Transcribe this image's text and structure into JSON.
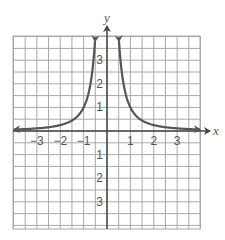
{
  "chart_data": {
    "type": "line",
    "title": "",
    "xlabel": "x",
    "ylabel": "y",
    "xlim": [
      -4,
      4
    ],
    "ylim": [
      -4,
      4
    ],
    "grid": true,
    "grid_step": 0.5,
    "x_ticks": [
      -3,
      -2,
      -1,
      1,
      2,
      3
    ],
    "x_tick_labels": [
      "−3",
      "−2",
      "−1",
      "1",
      "2",
      "3"
    ],
    "y_ticks": [
      3,
      2,
      1,
      -1,
      -2,
      -3
    ],
    "y_tick_labels": [
      "3",
      "2",
      "1",
      "1",
      "2",
      "3"
    ],
    "series": [
      {
        "name": "y = 1/x²",
        "function": "1/x^2",
        "x": [
          -4,
          -3,
          -2,
          -1.5,
          -1,
          -0.75,
          -0.5,
          0.5,
          0.75,
          1,
          1.5,
          2,
          3,
          4
        ],
        "values": [
          0.0625,
          0.111,
          0.25,
          0.444,
          1,
          1.778,
          4,
          4,
          1.778,
          1,
          0.444,
          0.25,
          0.111,
          0.0625
        ],
        "color": "#555555",
        "arrows_at_ends": true
      }
    ],
    "legend": null
  },
  "colors": {
    "grid": "#a8a8a8",
    "axis": "#444444",
    "curve": "#555555",
    "label": "#555555"
  }
}
